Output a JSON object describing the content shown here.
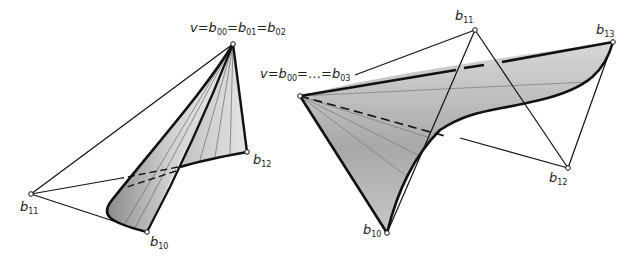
{
  "figures": [
    {
      "id": "left",
      "description": "Cone-like Bezier surface patch with apex vertex and control polygon",
      "points": {
        "apex": {
          "x": 233,
          "y": 44
        },
        "b11": {
          "x": 31,
          "y": 194
        },
        "b10": {
          "x": 147,
          "y": 232
        },
        "b12": {
          "x": 247,
          "y": 152
        }
      },
      "labels": {
        "apex": {
          "v": "v",
          "eq": "=",
          "b00": "00",
          "b01": "01",
          "b02": "02"
        },
        "b11": {
          "b": "b",
          "sub": "11"
        },
        "b10": {
          "b": "b",
          "sub": "10"
        },
        "b12": {
          "b": "b",
          "sub": "12"
        }
      }
    },
    {
      "id": "right",
      "description": "Twisted Bezier surface patch with degenerate vertex and control polygon",
      "points": {
        "apex": {
          "x": 300,
          "y": 96
        },
        "b11": {
          "x": 475,
          "y": 30
        },
        "b13": {
          "x": 613,
          "y": 42
        },
        "b12": {
          "x": 568,
          "y": 168
        },
        "b10": {
          "x": 387,
          "y": 233
        }
      },
      "labels": {
        "apex": {
          "v": "v",
          "b00": "00",
          "dots": "…",
          "b03": "03"
        },
        "b11": {
          "b": "b",
          "sub": "11"
        },
        "b13": {
          "b": "b",
          "sub": "13"
        },
        "b12": {
          "b": "b",
          "sub": "12"
        },
        "b10": {
          "b": "b",
          "sub": "10"
        }
      }
    }
  ],
  "colors": {
    "surface_light": "#e6e6e6",
    "surface_mid": "#c8c8c8",
    "surface_dark": "#9a9a9a",
    "edge": "#111111",
    "ruling": "#6a6a6a"
  }
}
